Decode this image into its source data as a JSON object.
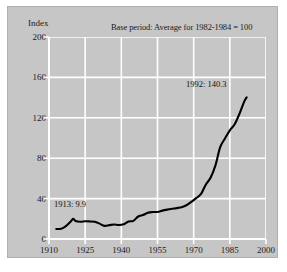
{
  "figure": {
    "index_label": "Index",
    "note": "Base period: Average for 1982-1984 = 100",
    "panel_color": "#c6c6c6",
    "grid_color": "#ffffff",
    "line_color": "#000000",
    "text_color": "#1a1a1a"
  },
  "annotations": [
    {
      "id": "start",
      "label": "1913:  9.9",
      "year": 1913,
      "value": 9.9
    },
    {
      "id": "end",
      "label": "1992:  140.3",
      "year": 1992,
      "value": 140.3
    }
  ],
  "chart_data": {
    "type": "line",
    "title": "",
    "subtitle": "Base period: Average for 1982-1984 = 100",
    "xlabel": "",
    "ylabel": "Index",
    "xlim": [
      1910,
      2000
    ],
    "ylim": [
      0,
      200
    ],
    "xticks": [
      1910,
      1925,
      1940,
      1955,
      1970,
      1985,
      2000
    ],
    "yticks": [
      0,
      40,
      80,
      120,
      160,
      200
    ],
    "grid": true,
    "legend": "none",
    "series": [
      {
        "name": "Consumer Price Index",
        "x": [
          1913,
          1915,
          1917,
          1919,
          1920,
          1921,
          1923,
          1925,
          1927,
          1929,
          1931,
          1933,
          1935,
          1937,
          1939,
          1941,
          1943,
          1945,
          1947,
          1949,
          1951,
          1953,
          1955,
          1957,
          1959,
          1961,
          1963,
          1965,
          1967,
          1969,
          1971,
          1973,
          1975,
          1977,
          1979,
          1981,
          1983,
          1985,
          1987,
          1989,
          1991,
          1992
        ],
        "y": [
          9.9,
          10.1,
          12.8,
          17.3,
          20.0,
          17.9,
          17.1,
          17.5,
          17.4,
          17.1,
          15.2,
          13.0,
          13.7,
          14.4,
          13.9,
          14.7,
          17.3,
          18.0,
          22.3,
          23.8,
          26.0,
          26.7,
          26.8,
          28.1,
          29.1,
          29.9,
          30.6,
          31.5,
          33.4,
          36.7,
          40.5,
          44.4,
          53.8,
          60.6,
          72.6,
          90.9,
          99.6,
          107.6,
          113.6,
          124.0,
          136.2,
          140.3
        ]
      }
    ]
  }
}
